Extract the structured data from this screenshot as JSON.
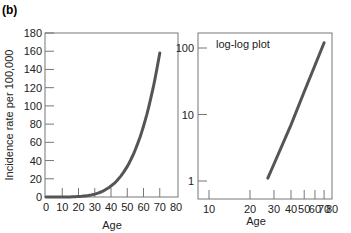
{
  "panel_label": "(b)",
  "chart_data": [
    {
      "type": "line",
      "title": "",
      "xlabel": "Age",
      "ylabel": "Incidence rate per 100,000",
      "xlim": [
        0,
        80
      ],
      "ylim": [
        0,
        180
      ],
      "xticks": [
        0,
        10,
        20,
        30,
        40,
        50,
        60,
        70,
        80
      ],
      "yticks": [
        0,
        20,
        40,
        60,
        80,
        100,
        120,
        140,
        160,
        180
      ],
      "grid": false,
      "series": [
        {
          "name": "Incidence",
          "x": [
            0,
            10,
            20,
            30,
            40,
            50,
            60,
            70
          ],
          "y": [
            0,
            0.1,
            1.3,
            6.8,
            21,
            52,
            108,
            158
          ]
        }
      ],
      "color": "#555555"
    },
    {
      "type": "line",
      "title": "",
      "annotation": "log-log plot",
      "xlabel": "Age",
      "ylabel": "",
      "xscale": "log",
      "yscale": "log",
      "xlim": [
        7,
        80
      ],
      "ylim": [
        0.75,
        140
      ],
      "xticks": [
        10,
        20,
        30,
        40,
        50,
        60,
        70,
        80
      ],
      "yticks": [
        1,
        10,
        100
      ],
      "grid": false,
      "series": [
        {
          "name": "Incidence (log-log)",
          "x": [
            27,
            30,
            40,
            50,
            60,
            70
          ],
          "y": [
            1.1,
            1.8,
            7,
            22,
            55,
            120
          ]
        }
      ],
      "color": "#555555"
    }
  ]
}
